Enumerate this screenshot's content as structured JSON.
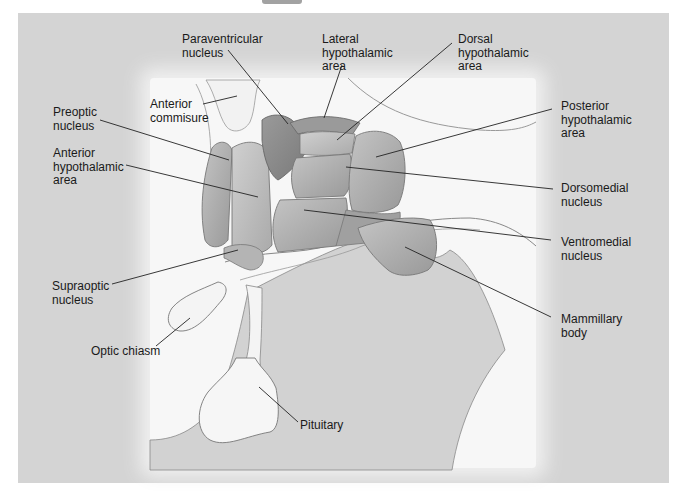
{
  "figure": {
    "title_fragment_visible": true,
    "colors": {
      "background": "#d4d4d4",
      "highlight": "#f7f7f7",
      "nucleus_dark": "#8a8a8a",
      "nucleus_mid": "#a8a8a8",
      "nucleus_light": "#bdbdbd",
      "leader_line": "#222222",
      "outline": "#6e6e6e"
    }
  },
  "labels": {
    "paraventricular": "Paraventricular\nnucleus",
    "lateral": "Lateral\nhypothalamic\narea",
    "dorsal": "Dorsal\nhypothalamic\narea",
    "anterior_commisure": "Anterior\ncommisure",
    "preoptic": "Preoptic\nnucleus",
    "posterior": "Posterior\nhypothalamic\narea",
    "anterior_hypothalamic": "Anterior\nhypothalamic\narea",
    "dorsomedial": "Dorsomedial\nnucleus",
    "ventromedial": "Ventromedial\nnucleus",
    "supraoptic": "Supraoptic\nnucleus",
    "mammillary": "Mammillary\nbody",
    "optic_chiasm": "Optic chiasm",
    "pituitary": "Pituitary"
  }
}
